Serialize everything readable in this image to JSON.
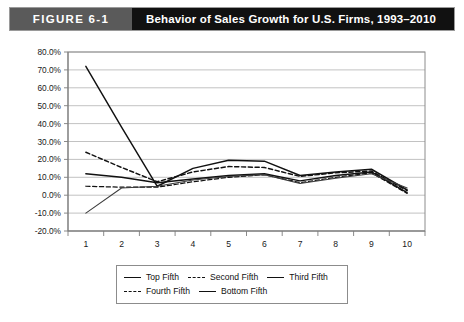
{
  "header": {
    "tag": "FIGURE 6-1",
    "title": "Behavior of Sales Growth for U.S. Firms, 1993–2010"
  },
  "legend": {
    "items": [
      {
        "label": "Top Fifth",
        "style": "solid"
      },
      {
        "label": "Second Fifth",
        "style": "dashed"
      },
      {
        "label": "Third Fifth",
        "style": "solid"
      },
      {
        "label": "Fourth Fifth",
        "style": "dashed"
      },
      {
        "label": "Bottom Fifth",
        "style": "solid"
      }
    ]
  },
  "chart_data": {
    "type": "line",
    "title": "Behavior of Sales Growth for U.S. Firms, 1993–2010",
    "xlabel": "",
    "ylabel": "",
    "categories": [
      "1",
      "2",
      "3",
      "4",
      "5",
      "6",
      "7",
      "8",
      "9",
      "10"
    ],
    "x": [
      1,
      2,
      3,
      4,
      5,
      6,
      7,
      8,
      9,
      10
    ],
    "ylim": [
      -20,
      80
    ],
    "ytick_labels": [
      "80.0%",
      "70.0%",
      "60.0%",
      "50.0%",
      "40.0%",
      "30.0%",
      "20.0%",
      "10.0%",
      "0.0%",
      "-10.0%",
      "-20.0%"
    ],
    "ytick_values": [
      80,
      70,
      60,
      50,
      40,
      30,
      20,
      10,
      0,
      -10,
      -20
    ],
    "grid": true,
    "legend_position": "bottom",
    "series": [
      {
        "name": "Top Fifth",
        "style": "solid",
        "values": [
          72.0,
          38.0,
          5.0,
          15.0,
          19.5,
          19.0,
          11.0,
          13.0,
          14.5,
          3.0
        ]
      },
      {
        "name": "Second Fifth",
        "style": "dashed",
        "values": [
          24.0,
          15.5,
          7.5,
          13.0,
          16.0,
          15.5,
          10.5,
          12.5,
          13.5,
          2.5
        ]
      },
      {
        "name": "Third Fifth",
        "style": "solid",
        "values": [
          12.0,
          10.0,
          7.0,
          9.0,
          11.0,
          12.0,
          8.0,
          11.0,
          13.0,
          1.5
        ]
      },
      {
        "name": "Fourth Fifth",
        "style": "dashed",
        "values": [
          5.0,
          4.5,
          4.5,
          7.5,
          10.0,
          11.5,
          7.0,
          10.0,
          12.5,
          1.0
        ]
      },
      {
        "name": "Bottom Fifth",
        "style": "solid",
        "values": [
          -10.0,
          4.0,
          5.0,
          8.5,
          10.5,
          11.5,
          6.5,
          9.5,
          12.0,
          4.0
        ]
      }
    ]
  }
}
